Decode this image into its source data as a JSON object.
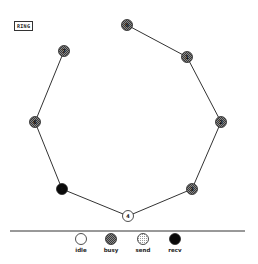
{
  "title": "RING",
  "colors": {
    "line": "#333333",
    "idle": "#ffffff",
    "busy": "#6e6e6e",
    "send": "#e8e8e8",
    "recv": "#0a0a0a",
    "stroke": "#222222"
  },
  "nodes": [
    {
      "id": "0",
      "x": 127,
      "y": 25,
      "state": "busy"
    },
    {
      "id": "1",
      "x": 187,
      "y": 57,
      "state": "busy"
    },
    {
      "id": "2",
      "x": 221,
      "y": 122,
      "state": "busy"
    },
    {
      "id": "3",
      "x": 192,
      "y": 189,
      "state": "busy"
    },
    {
      "id": "4",
      "x": 128,
      "y": 216,
      "state": "idle"
    },
    {
      "id": "5",
      "x": 62,
      "y": 189,
      "state": "recv"
    },
    {
      "id": "6",
      "x": 35,
      "y": 122,
      "state": "busy"
    },
    {
      "id": "7",
      "x": 64,
      "y": 51,
      "state": "busy"
    }
  ],
  "edges": [
    [
      0,
      1
    ],
    [
      1,
      2
    ],
    [
      2,
      3
    ],
    [
      3,
      4
    ],
    [
      4,
      5
    ],
    [
      5,
      6
    ],
    [
      6,
      7
    ]
  ],
  "separator": {
    "x1": 10,
    "x2": 245,
    "y": 231
  },
  "legend": [
    {
      "state": "idle",
      "label": "idle",
      "x": 81,
      "y": 239
    },
    {
      "state": "busy",
      "label": "busy",
      "x": 111,
      "y": 239
    },
    {
      "state": "send",
      "label": "send",
      "x": 143,
      "y": 239
    },
    {
      "state": "recv",
      "label": "recv",
      "x": 175,
      "y": 239
    }
  ]
}
